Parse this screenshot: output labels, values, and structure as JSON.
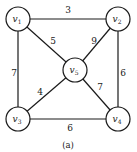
{
  "diagram": {
    "type": "weighted-undirected-graph",
    "caption": "(a)",
    "nodes": [
      {
        "id": "v1",
        "base": "v",
        "sub": "1",
        "x": 18,
        "y": 19
      },
      {
        "id": "v2",
        "base": "v",
        "sub": "2",
        "x": 118,
        "y": 19
      },
      {
        "id": "v5",
        "base": "v",
        "sub": "5",
        "x": 75,
        "y": 70
      },
      {
        "id": "v3",
        "base": "v",
        "sub": "3",
        "x": 18,
        "y": 119
      },
      {
        "id": "v4",
        "base": "v",
        "sub": "4",
        "x": 118,
        "y": 119
      }
    ],
    "edges": [
      {
        "from": "v1",
        "to": "v2",
        "weight": "3",
        "lx": 68,
        "ly": 13
      },
      {
        "from": "v1",
        "to": "v5",
        "weight": "5",
        "lx": 53,
        "ly": 44
      },
      {
        "from": "v2",
        "to": "v5",
        "weight": "9",
        "lx": 94,
        "ly": 44
      },
      {
        "from": "v1",
        "to": "v3",
        "weight": "7",
        "lx": 14,
        "ly": 76
      },
      {
        "from": "v2",
        "to": "v4",
        "weight": "6",
        "lx": 123,
        "ly": 76
      },
      {
        "from": "v3",
        "to": "v5",
        "weight": "4",
        "lx": 40,
        "ly": 95
      },
      {
        "from": "v5",
        "to": "v4",
        "weight": "7",
        "lx": 100,
        "ly": 90
      },
      {
        "from": "v3",
        "to": "v4",
        "weight": "6",
        "lx": 70,
        "ly": 131
      }
    ],
    "colors": {
      "stroke": "#1a1a1a",
      "background": "#ffffff"
    }
  }
}
